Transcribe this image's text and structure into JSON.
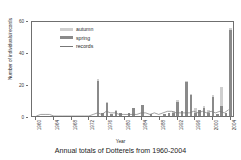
{
  "chart_data": {
    "type": "bar",
    "title": "Annual totals of Dotterels from 1960-2004",
    "xlabel": "Year",
    "ylabel": "Number of individuals/records",
    "ylim": [
      0,
      60
    ],
    "yticks": [
      0,
      20,
      40,
      60
    ],
    "xlim": [
      1959,
      2005
    ],
    "xticks": [
      1960,
      1964,
      1968,
      1972,
      1976,
      1980,
      1984,
      1988,
      1992,
      1996,
      2000,
      2004
    ],
    "grid": false,
    "legend_position": "upper-left-inside",
    "stacked": true,
    "x": [
      1960,
      1961,
      1962,
      1963,
      1964,
      1965,
      1966,
      1967,
      1968,
      1969,
      1970,
      1971,
      1972,
      1973,
      1974,
      1975,
      1976,
      1977,
      1978,
      1979,
      1980,
      1981,
      1982,
      1983,
      1984,
      1985,
      1986,
      1987,
      1988,
      1989,
      1990,
      1991,
      1992,
      1993,
      1994,
      1995,
      1996,
      1997,
      1998,
      1999,
      2000,
      2001,
      2002,
      2003,
      2004
    ],
    "series": [
      {
        "name": "spring",
        "color": "#8a8a8a",
        "values": [
          0,
          0,
          0,
          0,
          0,
          0,
          0,
          0,
          0,
          0,
          0,
          0,
          0,
          0,
          22,
          2,
          8,
          1,
          3,
          2,
          0,
          2,
          5,
          0,
          7,
          0,
          1,
          0,
          0,
          1,
          2,
          2,
          9,
          3,
          21,
          13,
          2,
          4,
          5,
          2,
          12,
          1,
          6,
          2,
          54
        ]
      },
      {
        "name": "autumn",
        "color": "#cfcfcf",
        "values": [
          0,
          0,
          0,
          0,
          0,
          0,
          0,
          0,
          0,
          0,
          0,
          0,
          0,
          0,
          1,
          0,
          1,
          0,
          1,
          0,
          0,
          0,
          0,
          0,
          0,
          0,
          0,
          0,
          0,
          0,
          0,
          1,
          1,
          0,
          1,
          1,
          3,
          0,
          1,
          2,
          1,
          0,
          12,
          0,
          1
        ]
      },
      {
        "name": "records",
        "color": "#777777",
        "type": "line",
        "values": [
          0,
          1,
          1,
          1,
          0,
          0,
          0,
          0,
          0,
          0,
          0,
          0,
          0,
          1,
          2,
          1,
          3,
          2,
          2,
          1,
          1,
          1,
          1,
          1,
          2,
          2,
          1,
          2,
          1,
          2,
          3,
          3,
          2,
          2,
          2,
          2,
          3,
          2,
          3,
          2,
          3,
          2,
          3,
          2,
          4
        ]
      }
    ]
  },
  "legend": {
    "items": [
      {
        "label": "autumn",
        "swatch": "#cfcfcf",
        "kind": "swatch"
      },
      {
        "label": "spring",
        "swatch": "#8a8a8a",
        "kind": "swatch"
      },
      {
        "label": "records",
        "swatch": "#777777",
        "kind": "line"
      }
    ]
  }
}
